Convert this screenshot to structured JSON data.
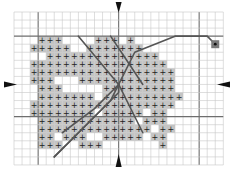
{
  "colors": {
    "background": "#ffffff",
    "grid_minor": "#c8c8c8",
    "grid_major": "#6e6e6e",
    "fill": "#c4c4c4",
    "symbol": "#222222",
    "backstitch": "#555555",
    "arrow": "#111111",
    "marker_fill": "#7a7a7a",
    "marker_dot": "#111111"
  },
  "grid": {
    "origin_x": 14,
    "origin_y": 12,
    "cell": 8.05,
    "cols": 26,
    "rows": 19,
    "major_every": 10,
    "major_col_offset": 3,
    "major_row_offset": 3
  },
  "symbol": "+",
  "stitch_rows": [
    "....................",
    "....................",
    "...###....###.#.....",
    "..#####..#######....",
    "....##############..",
    "..#################.",
    "..##################",
    "..###...############",
    "...###.....#########",
    "...#######.##########",
    "..##################",
    "..########.#####.##.",
    "...############.###.",
    "...##############.##",
    "...##.###..#####.##.",
    "...###..###.......#.",
    "...................."
  ],
  "backstitch_lines": [
    [
      [
        8,
        3
      ],
      [
        13,
        9
      ]
    ],
    [
      [
        12,
        3
      ],
      [
        14,
        6
      ],
      [
        16,
        9
      ]
    ],
    [
      [
        13,
        9
      ],
      [
        10,
        12
      ],
      [
        6,
        15
      ]
    ],
    [
      [
        13,
        9
      ],
      [
        13,
        10
      ],
      [
        9,
        14
      ],
      [
        5,
        18
      ]
    ],
    [
      [
        13,
        9
      ],
      [
        12,
        11
      ],
      [
        8,
        15
      ],
      [
        5,
        18
      ]
    ],
    [
      [
        13,
        9
      ],
      [
        15,
        5
      ],
      [
        20,
        3
      ],
      [
        24,
        3
      ],
      [
        25,
        4
      ]
    ],
    [
      [
        13,
        9
      ],
      [
        16,
        15
      ]
    ]
  ],
  "stem_marker": {
    "col": 25,
    "row": 4,
    "label": "start-point"
  },
  "center_arrows": {
    "top": "▼",
    "bottom": "▲",
    "left": "►",
    "right": "◄"
  }
}
